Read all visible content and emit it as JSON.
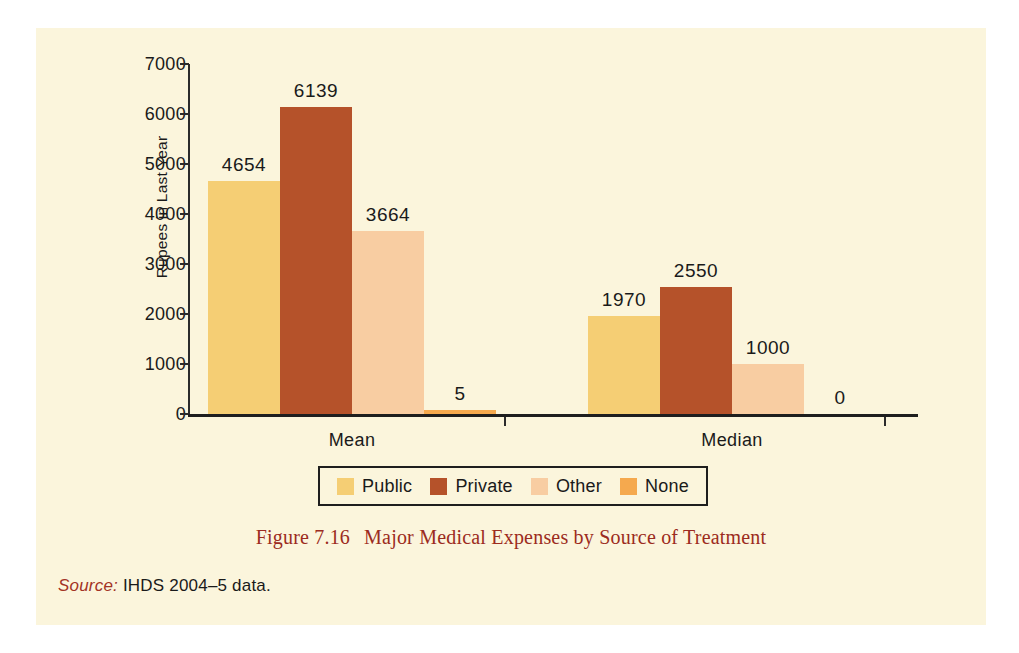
{
  "figure": {
    "caption_number": "Figure 7.16",
    "caption_title": "Major Medical Expenses by Source of Treatment",
    "source_label": "Source:",
    "source_text": " IHDS 2004–5 data.",
    "panel_background": "#fbf5dc",
    "caption_color": "#9c2b20"
  },
  "chart_data": {
    "type": "bar",
    "title": "Major Medical Expenses by Source of Treatment",
    "xlabel": "",
    "ylabel": "Rupees in Last Year",
    "categories": [
      "Mean",
      "Median"
    ],
    "ylim": [
      0,
      7000
    ],
    "yticks": [
      0,
      1000,
      2000,
      3000,
      4000,
      5000,
      6000,
      7000
    ],
    "ytick_labels": [
      "0",
      "1000",
      "2000",
      "3000",
      "4000",
      "5000",
      "6000",
      "7000"
    ],
    "grid": false,
    "legend_position": "bottom",
    "series": [
      {
        "name": "Public",
        "color": "#f5ce74",
        "values": [
          4654,
          1970
        ],
        "labels": [
          "4654",
          "1970"
        ]
      },
      {
        "name": "Private",
        "color": "#b5522a",
        "values": [
          6139,
          2550
        ],
        "labels": [
          "6139",
          "2550"
        ]
      },
      {
        "name": "Other",
        "color": "#f8cda2",
        "values": [
          3664,
          1000
        ],
        "labels": [
          "3664",
          "1000"
        ]
      },
      {
        "name": "None",
        "color": "#f5a94e",
        "values": [
          5,
          0
        ],
        "labels": [
          "5",
          "0"
        ]
      }
    ]
  },
  "legend": {
    "items": [
      {
        "label": "Public",
        "color": "#f5ce74"
      },
      {
        "label": "Private",
        "color": "#b5522a"
      },
      {
        "label": "Other",
        "color": "#f8cda2"
      },
      {
        "label": "None",
        "color": "#f5a94e"
      }
    ]
  }
}
